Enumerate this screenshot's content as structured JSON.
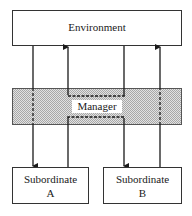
{
  "diagram": {
    "title": "",
    "nodes": [
      {
        "id": "environment",
        "label": "Environment"
      },
      {
        "id": "manager",
        "label": "Manager",
        "style": "shaded band"
      },
      {
        "id": "subordinate_a",
        "label_line1": "Subordinate",
        "label_line2": "A"
      },
      {
        "id": "subordinate_b",
        "label_line1": "Subordinate",
        "label_line2": "B"
      }
    ],
    "edges": [
      {
        "from": "environment",
        "to": "subordinate_a",
        "direction": "down",
        "passes_through": "manager"
      },
      {
        "from": "subordinate_a",
        "to": "environment",
        "direction": "up",
        "via": "manager (dashed loop)"
      },
      {
        "from": "environment",
        "to": "subordinate_b",
        "direction": "down",
        "via": "manager (dashed loop)"
      },
      {
        "from": "subordinate_b",
        "to": "environment",
        "direction": "up",
        "passes_through": "manager"
      }
    ],
    "colors": {
      "line": "#1a1a1a",
      "manager_fill": "#c8c8c8",
      "box_fill": "#ffffff"
    }
  }
}
